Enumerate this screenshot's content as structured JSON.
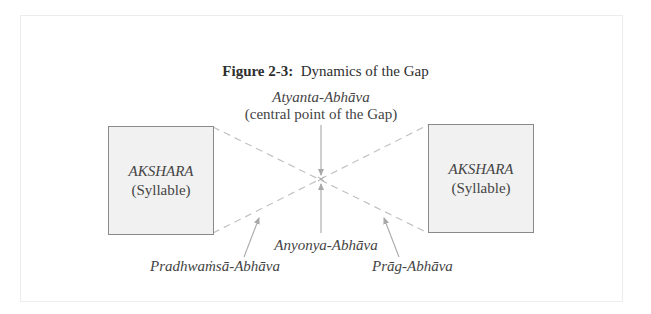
{
  "figure": {
    "title_label": "Figure 2-3:",
    "title_text": "Dynamics of the Gap"
  },
  "center_label": {
    "name": "Atyanta-Abhāva",
    "description": "(central point of the Gap)"
  },
  "boxes": [
    {
      "name": "AKSHARA",
      "sub": "(Syllable)",
      "position": "left"
    },
    {
      "name": "AKSHARA",
      "sub": "(Syllable)",
      "position": "right"
    }
  ],
  "bottom_labels": {
    "middle": "Anyonya-Abhāva",
    "left": "Pradhwaṁsā-Abhāva",
    "right": "Prāg-Abhāva"
  },
  "colors": {
    "box_fill": "#f1f1f1",
    "box_border": "#8a8a8a",
    "line": "#bdbdbd",
    "text": "#444444"
  }
}
